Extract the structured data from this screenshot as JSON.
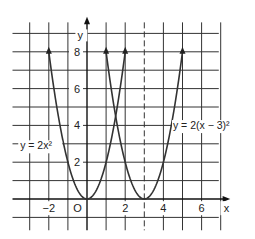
{
  "chart_data": {
    "type": "line",
    "title": "",
    "xlabel": "x",
    "ylabel": "y",
    "xlim": [
      -3,
      7
    ],
    "ylim": [
      -1,
      9
    ],
    "grid": true,
    "x_ticks": [
      -2,
      0,
      2,
      4,
      6
    ],
    "x_tick_labels": [
      "−2",
      "O",
      "2",
      "4",
      "6"
    ],
    "y_ticks": [
      2,
      4,
      6,
      8
    ],
    "y_tick_labels": [
      "2",
      "4",
      "6",
      "8"
    ],
    "dashed_line": {
      "x": 3
    },
    "series": [
      {
        "name": "y = 2x²",
        "formula": "2*x^2",
        "x": [
          -2,
          -1.5,
          -1,
          -0.5,
          0,
          0.5,
          1,
          1.5,
          2
        ],
        "values": [
          8,
          4.5,
          2,
          0.5,
          0,
          0.5,
          2,
          4.5,
          8
        ]
      },
      {
        "name": "y = 2(x − 3)²",
        "formula": "2*(x-3)^2",
        "x": [
          1,
          1.5,
          2,
          2.5,
          3,
          3.5,
          4,
          4.5,
          5
        ],
        "values": [
          8,
          4.5,
          2,
          0.5,
          0,
          0.5,
          2,
          4.5,
          8
        ]
      }
    ],
    "annotations": [
      {
        "text": "y = 2x²",
        "near": [
          -2.8,
          2.7
        ]
      },
      {
        "text": "y = 2(x − 3)²",
        "near": [
          4.3,
          3.8
        ]
      }
    ]
  },
  "labels": {
    "x_axis": "x",
    "y_axis": "y",
    "origin": "O",
    "x_ticks": [
      "−2",
      "2",
      "4",
      "6"
    ],
    "y_ticks": [
      "2",
      "4",
      "6",
      "8"
    ],
    "eq1": "y = 2x²",
    "eq2": "y = 2(x − 3)²"
  }
}
